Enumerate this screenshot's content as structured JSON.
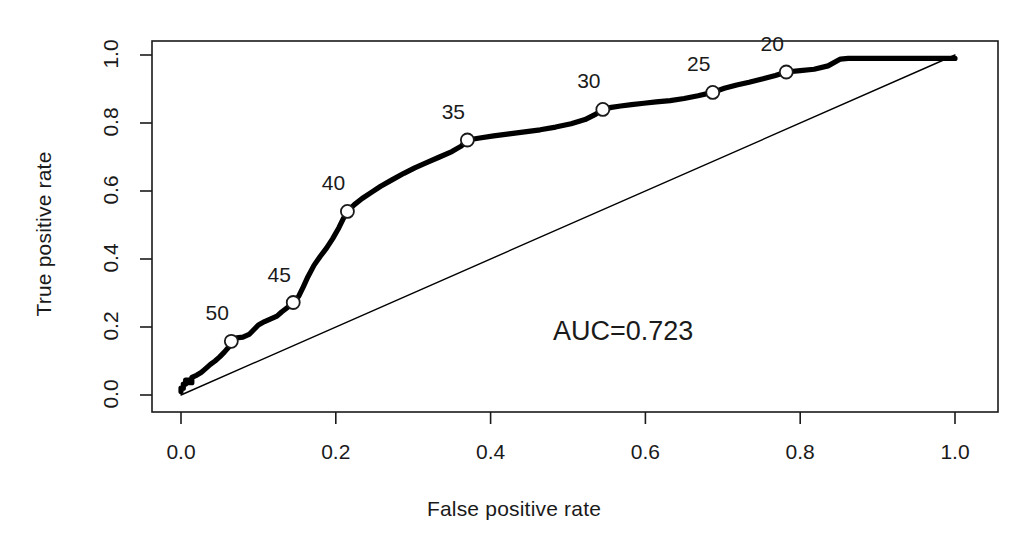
{
  "chart_data": {
    "type": "line",
    "title": "",
    "subtitle": "",
    "xlabel": "False positive rate",
    "ylabel": "True positive rate",
    "xlim": [
      0.0,
      1.0
    ],
    "ylim": [
      0.0,
      1.0
    ],
    "grid": false,
    "legend": "none",
    "xticks": [
      "0.0",
      "0.2",
      "0.4",
      "0.6",
      "0.8",
      "1.0"
    ],
    "xtick_values": [
      0.0,
      0.2,
      0.4,
      0.6,
      0.8,
      1.0
    ],
    "yticks": [
      "0.0",
      "0.2",
      "0.4",
      "0.6",
      "0.8",
      "1.0"
    ],
    "ytick_values": [
      0.0,
      0.2,
      0.4,
      0.6,
      0.8,
      1.0
    ],
    "annotations": [
      {
        "name": "auc",
        "text": "AUC=0.723",
        "x": 0.52,
        "y": 0.3
      }
    ],
    "series": [
      {
        "name": "ROC curve",
        "style": "solid-thick",
        "color": "#000000",
        "x": [
          0.0,
          0.0,
          0.003,
          0.003,
          0.006,
          0.006,
          0.01,
          0.01,
          0.014,
          0.014,
          0.02,
          0.026,
          0.03,
          0.034,
          0.038,
          0.044,
          0.05,
          0.056,
          0.062,
          0.065,
          0.072,
          0.08,
          0.088,
          0.094,
          0.1,
          0.108,
          0.116,
          0.124,
          0.13,
          0.138,
          0.145,
          0.152,
          0.158,
          0.164,
          0.172,
          0.18,
          0.188,
          0.196,
          0.204,
          0.21,
          0.215,
          0.224,
          0.234,
          0.246,
          0.258,
          0.272,
          0.288,
          0.302,
          0.318,
          0.334,
          0.35,
          0.362,
          0.37,
          0.386,
          0.404,
          0.424,
          0.444,
          0.464,
          0.484,
          0.504,
          0.522,
          0.536,
          0.545,
          0.556,
          0.568,
          0.582,
          0.598,
          0.614,
          0.632,
          0.65,
          0.668,
          0.687,
          0.702,
          0.718,
          0.734,
          0.752,
          0.768,
          0.782,
          0.8,
          0.818,
          0.836,
          0.852,
          0.862,
          0.9,
          0.94,
          0.97,
          1.0
        ],
        "y": [
          0.01,
          0.02,
          0.02,
          0.032,
          0.032,
          0.044,
          0.044,
          0.036,
          0.036,
          0.052,
          0.058,
          0.066,
          0.074,
          0.082,
          0.09,
          0.1,
          0.112,
          0.126,
          0.142,
          0.158,
          0.168,
          0.17,
          0.178,
          0.192,
          0.206,
          0.216,
          0.224,
          0.232,
          0.244,
          0.258,
          0.272,
          0.29,
          0.318,
          0.348,
          0.382,
          0.408,
          0.432,
          0.46,
          0.492,
          0.52,
          0.54,
          0.56,
          0.578,
          0.596,
          0.614,
          0.632,
          0.652,
          0.668,
          0.684,
          0.7,
          0.716,
          0.732,
          0.75,
          0.756,
          0.762,
          0.768,
          0.774,
          0.78,
          0.788,
          0.798,
          0.81,
          0.826,
          0.84,
          0.846,
          0.85,
          0.854,
          0.858,
          0.862,
          0.866,
          0.872,
          0.88,
          0.89,
          0.902,
          0.912,
          0.92,
          0.93,
          0.94,
          0.95,
          0.954,
          0.958,
          0.968,
          0.988,
          0.99,
          0.99,
          0.99,
          0.99,
          0.99
        ]
      },
      {
        "name": "chance diagonal",
        "style": "solid-thin",
        "color": "#000000",
        "x": [
          0.0,
          1.0
        ],
        "y": [
          0.0,
          1.0
        ]
      }
    ],
    "marked_points": [
      {
        "label": "50",
        "x": 0.065,
        "y": 0.158,
        "label_dx": -14,
        "label_dy": -26
      },
      {
        "label": "45",
        "x": 0.145,
        "y": 0.272,
        "label_dx": -14,
        "label_dy": -26
      },
      {
        "label": "40",
        "x": 0.215,
        "y": 0.54,
        "label_dx": -14,
        "label_dy": -26
      },
      {
        "label": "35",
        "x": 0.37,
        "y": 0.75,
        "label_dx": -14,
        "label_dy": -26
      },
      {
        "label": "30",
        "x": 0.545,
        "y": 0.84,
        "label_dx": -14,
        "label_dy": -26
      },
      {
        "label": "25",
        "x": 0.687,
        "y": 0.89,
        "label_dx": -14,
        "label_dy": -26
      },
      {
        "label": "20",
        "x": 0.782,
        "y": 0.95,
        "label_dx": -14,
        "label_dy": -26
      }
    ]
  },
  "figure": {
    "background_color": "#ffffff",
    "foreground_color": "#1a1a1a"
  }
}
